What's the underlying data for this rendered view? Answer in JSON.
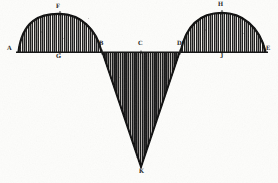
{
  "figure": {
    "type": "engraved-geometric-diagram",
    "medium": "line engraving with vertical hatching",
    "background_color": "#fdfdfb",
    "ink_color": "#1a1a1a",
    "width": 278,
    "height": 183,
    "baseline": {
      "name": "baseline A-E",
      "y": 52,
      "x_start": 16,
      "x_end": 268
    },
    "labels": [
      {
        "id": "A",
        "text": "A",
        "x": 10,
        "y": 50,
        "anchor": "left end of baseline"
      },
      {
        "id": "F",
        "text": "F",
        "x": 58,
        "y": 9,
        "anchor": "apex of left arc"
      },
      {
        "id": "G",
        "text": "G",
        "x": 58,
        "y": 57,
        "anchor": "midpoint of segment A-B"
      },
      {
        "id": "B",
        "text": "B",
        "x": 101,
        "y": 45,
        "anchor": "left vertex of triangle"
      },
      {
        "id": "C",
        "text": "C",
        "x": 140,
        "y": 45,
        "anchor": "midpoint of segment B-D"
      },
      {
        "id": "D",
        "text": "D",
        "x": 178,
        "y": 45,
        "anchor": "right vertex of triangle"
      },
      {
        "id": "J",
        "text": "J",
        "x": 221,
        "y": 57,
        "anchor": "midpoint of segment D-E"
      },
      {
        "id": "H",
        "text": "H",
        "x": 218,
        "y": 6,
        "anchor": "apex of right arc"
      },
      {
        "id": "E",
        "text": "E",
        "x": 268,
        "y": 50,
        "anchor": "right end of baseline"
      },
      {
        "id": "K",
        "text": "K",
        "x": 140,
        "y": 172,
        "anchor": "bottom vertex of triangle"
      }
    ],
    "shapes": [
      {
        "name": "left-arc",
        "kind": "arc",
        "label_apex": "F",
        "from": "A",
        "to": "B",
        "x_start": 18,
        "x_end": 102,
        "apex_x": 60,
        "apex_y": 14,
        "fill": "hatched",
        "position": "above baseline"
      },
      {
        "name": "center-triangle",
        "kind": "triangle",
        "vertices": [
          "B",
          "D",
          "K"
        ],
        "x_left": 102,
        "x_right": 180,
        "apex_x": 141,
        "apex_y": 168,
        "fill": "hatched",
        "position": "below baseline"
      },
      {
        "name": "right-arc",
        "kind": "arc",
        "label_apex": "H",
        "from": "D",
        "to": "E",
        "x_start": 180,
        "x_end": 266,
        "apex_x": 222,
        "apex_y": 13,
        "fill": "hatched",
        "position": "above baseline"
      }
    ],
    "hatching": {
      "direction": "vertical",
      "spacing_px": 2,
      "stroke_color": "#1c1c1c",
      "stroke_width": 1
    }
  }
}
